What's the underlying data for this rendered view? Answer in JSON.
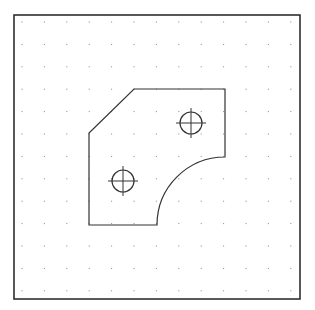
{
  "canvas": {
    "width": 315,
    "height": 310,
    "background": "#ffffff"
  },
  "frame": {
    "x": 14,
    "y": 15,
    "width": 286,
    "height": 284,
    "stroke": "#222222"
  },
  "grid": {
    "x0": 22,
    "y0": 22,
    "spacing": 22.4,
    "cols": 13,
    "rows": 13,
    "dot_color": "#888888"
  },
  "part": {
    "stroke": "#333333",
    "path": "M 89 225 L 89 133 L 134 89 L 225 89 L 225 157 A 68 68 0 0 0 157 225 Z"
  },
  "holes": [
    {
      "cx": 191,
      "cy": 123,
      "r": 11
    },
    {
      "cx": 123,
      "cy": 181,
      "r": 11
    }
  ]
}
